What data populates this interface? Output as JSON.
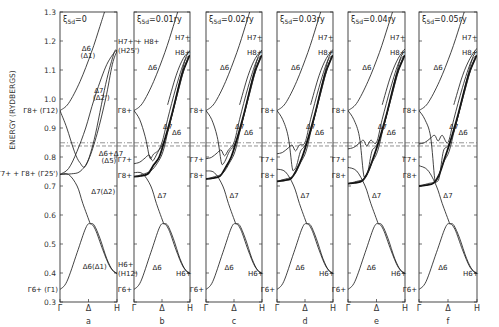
{
  "chart_data": {
    "type": "line",
    "title": "",
    "ylabel": "ENERGY (RYDBERGS)",
    "xlabel": "",
    "ylim": [
      0.3,
      1.3
    ],
    "yticks": [
      "1.3",
      "1.2",
      "1.1",
      "1.0",
      "0.9",
      "0.8",
      "0.7",
      "0.6",
      "0.5",
      "0.4",
      "0.3"
    ],
    "ytick_values": [
      1.3,
      1.2,
      1.1,
      1.0,
      0.9,
      0.8,
      0.7,
      0.6,
      0.5,
      0.4,
      0.3
    ],
    "xticks": [
      "Γ",
      "Δ",
      "H"
    ],
    "fermi_levels": [
      0.849,
      0.838
    ],
    "panels": [
      {
        "id": "a",
        "header": "ξ5d=0",
        "xi_label": "ξ",
        "xi_sub": "5d",
        "xi_value": "=0",
        "caption": "a",
        "labels": [
          {
            "text": "Δ6",
            "at": "upper-left-mid"
          },
          {
            "text": "(Δ1)",
            "at": "upper-left-mid"
          },
          {
            "text": "Δ7",
            "at": "mid"
          },
          {
            "text": "(Δ2')",
            "at": "mid"
          },
          {
            "text": "Δ6+Δ7",
            "at": "lower-right"
          },
          {
            "text": "(Δ5)",
            "at": "lower-right"
          },
          {
            "text": "Δ7(Δ2)",
            "at": "lower-mid"
          },
          {
            "text": "Δ6(Δ1)",
            "at": "bottom-mid"
          }
        ],
        "left_labels": [
          "Γ8+ (Γ12)",
          "Γ7+ + Γ8+ (Γ25')",
          "Γ6+ (Γ1)"
        ],
        "right_labels": [
          "H7+ + H8+",
          "(H25')",
          "H6+",
          "(H12)"
        ],
        "points": {
          "gamma_12": 0.96,
          "gamma_25p": 0.74,
          "gamma_1": 0.343,
          "H_25p": 1.165,
          "H_12": 0.398,
          "delta_max": 0.57
        }
      },
      {
        "id": "b",
        "header": "ξ5d=0.01ry",
        "xi_label": "ξ",
        "xi_sub": "5d",
        "xi_value": "=0.01ry",
        "caption": "b",
        "labels": [
          {
            "text": "Δ6",
            "at": "upper"
          },
          {
            "text": "Δ7",
            "at": "mid-right"
          },
          {
            "text": "Δ6",
            "at": "mid-right"
          },
          {
            "text": "Δ7",
            "at": "lower-mid"
          },
          {
            "text": "Δ6",
            "at": "bottom"
          }
        ],
        "left_labels": [
          "Γ8+",
          "Γ7+",
          "Γ8+",
          "Γ6+"
        ],
        "right_labels": [
          "H7+",
          "H8+",
          "H6+"
        ]
      },
      {
        "id": "c",
        "header": "ξ5d=0.02ry",
        "xi_label": "ξ",
        "xi_sub": "5d",
        "xi_value": "=0.02ry",
        "caption": "c",
        "labels": [
          {
            "text": "Δ6",
            "at": "upper"
          },
          {
            "text": "Δ7",
            "at": "mid-right"
          },
          {
            "text": "Δ6",
            "at": "mid-right"
          },
          {
            "text": "Δ7",
            "at": "lower-mid"
          },
          {
            "text": "Δ6",
            "at": "bottom"
          }
        ],
        "left_labels": [
          "Γ8+",
          "Γ7+",
          "Γ8+",
          "Γ6+"
        ],
        "right_labels": [
          "H7+",
          "H8+",
          "H6+"
        ]
      },
      {
        "id": "d",
        "header": "ξ5d=0.03ry",
        "xi_label": "ξ",
        "xi_sub": "5d",
        "xi_value": "=0.03ry",
        "caption": "d",
        "labels": [
          {
            "text": "Δ6",
            "at": "upper"
          },
          {
            "text": "Δ7",
            "at": "mid-right"
          },
          {
            "text": "Δ6",
            "at": "mid-right"
          },
          {
            "text": "Δ7",
            "at": "lower-mid"
          },
          {
            "text": "Δ6",
            "at": "bottom"
          }
        ],
        "left_labels": [
          "Γ8+",
          "Γ7+",
          "Γ8+",
          "Γ6+"
        ],
        "right_labels": [
          "H7+",
          "H8+",
          "H6+"
        ]
      },
      {
        "id": "e",
        "header": "ξ5d=0.04ry",
        "xi_label": "ξ",
        "xi_sub": "5d",
        "xi_value": "=0.04ry",
        "caption": "e",
        "labels": [
          {
            "text": "Δ6",
            "at": "upper"
          },
          {
            "text": "Δ7",
            "at": "mid-right"
          },
          {
            "text": "Δ6",
            "at": "mid-right"
          },
          {
            "text": "Δ7",
            "at": "lower-mid"
          },
          {
            "text": "Δ6",
            "at": "bottom"
          }
        ],
        "left_labels": [
          "Γ8+",
          "Γ7+",
          "Γ8+",
          "Γ6+"
        ],
        "right_labels": [
          "H7+",
          "H8+",
          "H6+"
        ]
      },
      {
        "id": "f",
        "header": "ξ5d=0.05ry",
        "xi_label": "ξ",
        "xi_sub": "5d",
        "xi_value": "=0.05ry",
        "caption": "f",
        "labels": [
          {
            "text": "Δ6",
            "at": "upper"
          },
          {
            "text": "Δ7",
            "at": "mid-right"
          },
          {
            "text": "Δ6",
            "at": "mid-right"
          },
          {
            "text": "Δ7",
            "at": "lower-mid"
          },
          {
            "text": "Δ6",
            "at": "bottom"
          }
        ],
        "left_labels": [
          "Γ8+",
          "Γ7+",
          "Γ8+",
          "Γ6+"
        ],
        "right_labels": [
          "H7+",
          "H8+",
          "H6+"
        ]
      }
    ]
  }
}
